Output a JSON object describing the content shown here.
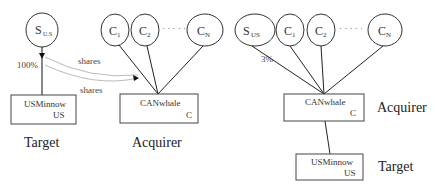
{
  "left_diagram": {
    "shareholder_node": {
      "main": "S",
      "sub": "U.S"
    },
    "canadian_nodes": [
      {
        "main": "C",
        "sub": "1"
      },
      {
        "main": "C",
        "sub": "2"
      },
      {
        "main": "C",
        "sub": "N"
      }
    ],
    "ellipsis": "· · · · ·",
    "ownership_label": "100%",
    "arrow_labels": [
      "shares",
      "shares"
    ],
    "target_box": {
      "name": "USMinnow",
      "country": "US"
    },
    "acquirer_box": {
      "name": "CANwhale",
      "country": "C"
    },
    "target_label": "Target",
    "acquirer_label": "Acquirer"
  },
  "right_diagram": {
    "shareholder_node": {
      "main": "S",
      "sub": "US"
    },
    "canadian_nodes": [
      {
        "main": "C",
        "sub": "1"
      },
      {
        "main": "C",
        "sub": "2"
      },
      {
        "main": "C",
        "sub": "N"
      }
    ],
    "ellipsis": "· · · · ·",
    "ownership_label": "3%",
    "acquirer_box": {
      "name": "CANwhale",
      "country": "C"
    },
    "target_box": {
      "name": "USMinnow",
      "country": "US"
    },
    "acquirer_label": "Acquirer",
    "target_label": "Target"
  }
}
